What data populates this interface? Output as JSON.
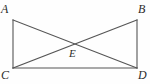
{
  "figure": {
    "type": "geometry-diagram",
    "background_color": "#fefefe",
    "line_color": "#555555",
    "label_color": "#2b2b2b",
    "stroke_width": 1,
    "labels": {
      "a": "A",
      "b": "B",
      "c": "C",
      "d": "D",
      "e": "E"
    },
    "points": {
      "A": {
        "x": 13,
        "y": 20
      },
      "B": {
        "x": 137,
        "y": 20
      },
      "C": {
        "x": 13,
        "y": 68
      },
      "D": {
        "x": 137,
        "y": 68
      },
      "E": {
        "x": 75,
        "y": 44
      }
    },
    "segments": [
      {
        "name": "AC",
        "from": "A",
        "to": "C"
      },
      {
        "name": "BD",
        "from": "B",
        "to": "D"
      },
      {
        "name": "CD",
        "from": "C",
        "to": "D"
      },
      {
        "name": "AD",
        "from": "A",
        "to": "D"
      },
      {
        "name": "CB",
        "from": "C",
        "to": "B"
      }
    ]
  }
}
